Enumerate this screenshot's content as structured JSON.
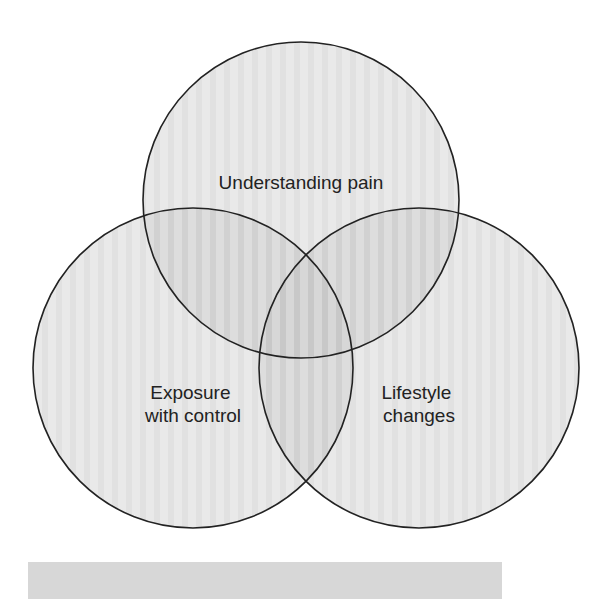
{
  "diagram": {
    "type": "venn",
    "circles": [
      {
        "id": "top",
        "label_lines": [
          "Understanding pain"
        ],
        "cx": 301,
        "cy": 200,
        "r": 158
      },
      {
        "id": "left",
        "label_lines": [
          "Exposure",
          "with control"
        ],
        "cx": 193,
        "cy": 368,
        "r": 160
      },
      {
        "id": "right",
        "label_lines": [
          "Lifestyle",
          "changes"
        ],
        "cx": 419,
        "cy": 368,
        "r": 160
      }
    ],
    "colors": {
      "fill": "#9a9a9a",
      "fill_opacity": 0.28,
      "stroke": "#222222",
      "background": "#ffffff",
      "bar": "#d7d7d7"
    }
  }
}
